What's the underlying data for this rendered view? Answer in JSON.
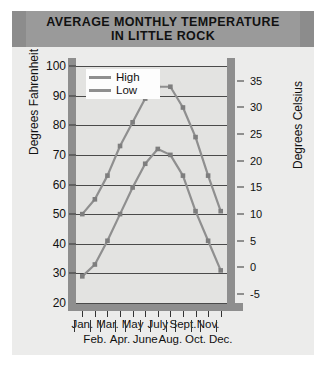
{
  "chart_data": {
    "type": "line",
    "title": "AVERAGE MONTHLY TEMPERATURE IN LITTLE ROCK",
    "title_line1": "AVERAGE MONTHLY TEMPERATURE",
    "title_line2": "IN LITTLE ROCK",
    "categories": [
      "Jan.",
      "Feb.",
      "Mar.",
      "Apr.",
      "May",
      "June",
      "July",
      "Aug.",
      "Sept.",
      "Oct.",
      "Nov.",
      "Dec."
    ],
    "series": [
      {
        "name": "High",
        "values": [
          50,
          55,
          63,
          73,
          81,
          89,
          93,
          93,
          86,
          76,
          63,
          51
        ],
        "color": "#8f8f8f"
      },
      {
        "name": "Low",
        "values": [
          29,
          33,
          41,
          50,
          59,
          67,
          72,
          70,
          63,
          51,
          41,
          31
        ],
        "color": "#8f8f8f"
      }
    ],
    "xlabel": "",
    "ylabel": "Degrees Fahrenheit",
    "ylabel_secondary": "Degrees Celsius",
    "ylim": [
      20,
      100
    ],
    "ylim_secondary": [
      -5,
      35
    ],
    "yticks": [
      100,
      90,
      80,
      70,
      60,
      50,
      40,
      30,
      20
    ],
    "yticks_secondary": [
      35,
      30,
      25,
      20,
      15,
      10,
      5,
      0,
      -5
    ],
    "grid": true,
    "legend_position": "top-left",
    "legend_entries": [
      "High",
      "Low"
    ],
    "units_primary": "Fahrenheit",
    "units_secondary": "Celsius",
    "colors": {
      "card": "#8c8c8c",
      "field": "#ececeb",
      "banner": "#9a9a9a",
      "plot": "#e3e3e1",
      "axis": "#8e8e8e",
      "grid": "#4a4a4a",
      "line": "#8f8f8f",
      "marker": "#7e7e7e"
    }
  },
  "months_row1": [
    "Jan.",
    "Mar.",
    "May",
    "July",
    "Sept.",
    "Nov."
  ],
  "months_row2": [
    "Feb.",
    "Apr.",
    "June",
    "Aug.",
    "Oct.",
    "Dec."
  ],
  "legend": {
    "high": "High",
    "low": "Low"
  },
  "axis": {
    "left_title": "Degrees Fahrenheit",
    "right_title": "Degrees Celsius"
  }
}
